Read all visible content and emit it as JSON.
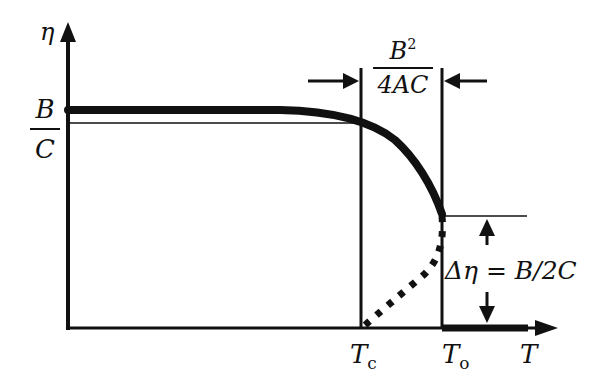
{
  "diagram": {
    "type": "order-parameter vs temperature (first-order transition)",
    "axes": {
      "y_label": "η",
      "x_label": "T"
    },
    "y_marker": {
      "numerator": "B",
      "denominator": "C",
      "meaning": "B/C"
    },
    "x_ticks": [
      {
        "base": "T",
        "sub": "c"
      },
      {
        "base": "T",
        "sub": "o"
      }
    ],
    "gap_label": {
      "numerator_base": "B",
      "numerator_sup": "2",
      "denominator": "4AC"
    },
    "jump_label": "Δη = B/2C",
    "curves": [
      {
        "name": "stable-branch",
        "style": "thick solid"
      },
      {
        "name": "unstable-branch",
        "style": "dotted"
      },
      {
        "name": "disordered-branch",
        "style": "thick solid on axis beyond To"
      }
    ],
    "colors": {
      "ink": "#111111",
      "background": "#ffffff"
    }
  }
}
